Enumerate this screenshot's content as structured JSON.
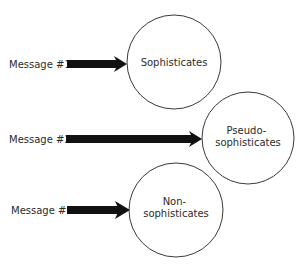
{
  "diagram": {
    "messages": [
      {
        "label": "Message #1",
        "target": "Sophisticates"
      },
      {
        "label": "Message #2",
        "target": "Pseudo-sophisticates"
      },
      {
        "label": "Message #3",
        "target": "Non-sophisticates"
      }
    ],
    "audiences": [
      {
        "lines": [
          "Sophisticates"
        ]
      },
      {
        "lines": [
          "Pseudo-",
          "sophisticates"
        ]
      },
      {
        "lines": [
          "Non-",
          "sophisticates"
        ]
      }
    ],
    "colors": {
      "arrow": "#111111",
      "circle_stroke": "#3a3a3a",
      "text": "#2b2b2b",
      "background": "#ffffff"
    }
  }
}
